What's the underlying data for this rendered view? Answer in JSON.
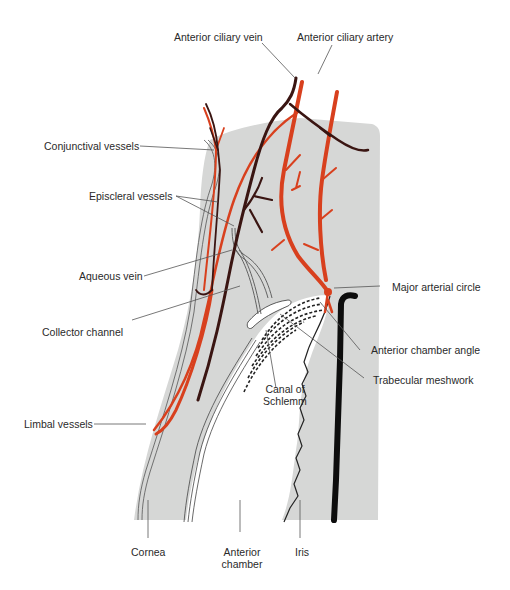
{
  "figure": {
    "colors": {
      "background": "#ffffff",
      "tissue_gray": "#d6d7d6",
      "artery_red": "#d8401e",
      "vein_dark": "#3a1512",
      "leader_line": "#555555",
      "iris_edge_black": "#0d0d0d",
      "label_text": "#2a2a2a"
    },
    "labels": {
      "anterior_ciliary_vein": "Anterior ciliary vein",
      "anterior_ciliary_artery": "Anterior ciliary artery",
      "conjunctival_vessels": "Conjunctival vessels",
      "episcleral_vessels": "Episcleral vessels",
      "aqueous_vein": "Aqueous vein",
      "collector_channel": "Collector channel",
      "major_arterial_circle": "Major arterial circle",
      "anterior_chamber_angle": "Anterior chamber angle",
      "trabecular_meshwork": "Trabecular meshwork",
      "canal_of_schlemm_line1": "Canal of",
      "canal_of_schlemm_line2": "Schlemm",
      "limbal_vessels": "Limbal vessels",
      "cornea": "Cornea",
      "anterior_chamber_line1": "Anterior",
      "anterior_chamber_line2": "chamber",
      "iris": "Iris"
    }
  }
}
